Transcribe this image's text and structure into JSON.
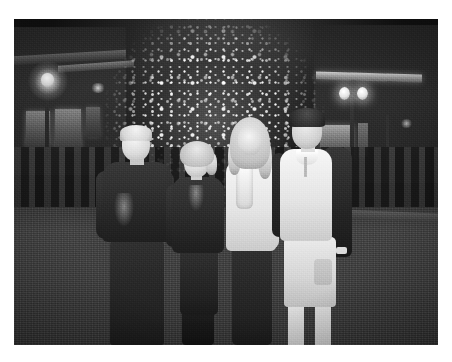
{
  "page": {
    "background_color": "#ffffff",
    "width": 452,
    "height": 362
  },
  "photo": {
    "type": "photograph",
    "rendering": "black-and-white / grayscale",
    "orientation": "landscape",
    "frame": {
      "x": 14,
      "y": 19,
      "width": 424,
      "height": 326
    },
    "alt_text": "Black and white night photograph of four people posing in front of a large lit Christmas tree in an outdoor shopping plaza",
    "scene": {
      "setting": "outdoor shopping plaza at night",
      "time_of_day": "night",
      "subject_count": 4
    },
    "colors": {
      "paper_white": "#ffffff",
      "night_sky": "#151515",
      "pavement_gray": "#414141",
      "highlight_white": "#f4f4f4",
      "shadow_black": "#141414"
    },
    "elements": {
      "tree": {
        "label": "lit christmas tree",
        "position": "center background",
        "description": "tall evergreen covered in dense small white bokeh lights"
      },
      "building_left": {
        "label": "building facade left",
        "description": "dark stucco storefront with lit windows, sloped roof line and a bright lamp"
      },
      "building_right": {
        "label": "building facade right",
        "description": "storefront with bright horizontal awning light bar, double globe lamp post and lit display window"
      },
      "lamp_left": {
        "label": "street lamp left",
        "glow": "bright white"
      },
      "lamp_right": {
        "label": "double globe lamp post right",
        "glow": "bright white"
      },
      "crowd": {
        "label": "background crowd",
        "description": "dark silhouettes of people standing along the plaza behind the group"
      },
      "ground": {
        "label": "plaza pavement",
        "description": "flat gray stone paving"
      }
    },
    "people": [
      {
        "id": "person-1",
        "label": "older man",
        "position": "far left",
        "hair": "short light gray",
        "clothing_top": "dark patterned short-sleeve shirt",
        "clothing_bottom": "dark trousers",
        "expression": "smiling"
      },
      {
        "id": "person-2",
        "label": "older woman",
        "position": "center left",
        "hair": "short light blonde",
        "clothing_top": "dark long-sleeve top with decorative neckline",
        "clothing_bottom": "dark pants with tall dark boots",
        "expression": "smiling"
      },
      {
        "id": "person-3",
        "label": "young woman",
        "position": "center right",
        "hair": "long light blonde",
        "clothing_top": "white long-sleeve top with light scarf",
        "clothing_bottom": "dark pants",
        "expression": "smiling"
      },
      {
        "id": "person-4",
        "label": "young man",
        "position": "far right",
        "hair": "short dark",
        "clothing_top": "white polo shirt under dark jacket",
        "clothing_bottom": "light cargo shorts",
        "accessory": "wristwatch",
        "expression": "smiling"
      }
    ]
  }
}
